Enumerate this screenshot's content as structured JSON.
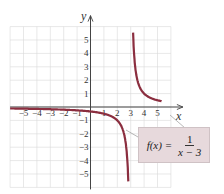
{
  "chart_data": {
    "type": "line",
    "title": "",
    "xlabel": "x",
    "ylabel": "y",
    "xlim": [
      -6,
      6
    ],
    "ylim": [
      -6,
      6
    ],
    "grid": true,
    "x_ticks": [
      -5,
      -4,
      -3,
      -2,
      -1,
      1,
      2,
      3,
      4,
      5
    ],
    "y_ticks": [
      -5,
      -4,
      -3,
      -2,
      -1,
      1,
      2,
      3,
      4,
      5
    ],
    "x_tick_labels": [
      "−5",
      "−4",
      "−3",
      "−2",
      "−1",
      "1",
      "2",
      "3",
      "4",
      "5"
    ],
    "y_tick_labels": [
      "−5",
      "−4",
      "−3",
      "−2",
      "−1",
      "1",
      "2",
      "3",
      "4",
      "5"
    ],
    "series": [
      {
        "name": "f(x) = 1/(x − 3)",
        "function": "1/(x-3)",
        "vertical_asymptote": 3,
        "horizontal_asymptote": 0,
        "color": "#8b2e3f"
      }
    ],
    "annotation": {
      "text": "f(x) = 1/(x − 3)",
      "lhs": "f(x) =",
      "numerator": "1",
      "denominator": "x − 3"
    }
  },
  "colors": {
    "curve": "#8b2e3f",
    "axis": "#444444",
    "grid": "#d9d9d9",
    "label_bg": "#e7d9dc"
  }
}
